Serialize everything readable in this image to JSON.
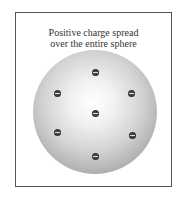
{
  "diagram": {
    "caption_line1": "Positive charge spread",
    "caption_line2": "over the entire sphere",
    "electrons": [
      {
        "x": 95,
        "y": 72,
        "label": "−"
      },
      {
        "x": 57,
        "y": 93,
        "label": "−"
      },
      {
        "x": 131,
        "y": 93,
        "label": "−"
      },
      {
        "x": 95,
        "y": 113,
        "label": "−"
      },
      {
        "x": 57,
        "y": 132,
        "label": "−"
      },
      {
        "x": 132,
        "y": 135,
        "label": "−"
      },
      {
        "x": 95,
        "y": 156,
        "label": "−"
      }
    ],
    "colors": {
      "frame": "#555555",
      "sphere_light": "#ffffff",
      "sphere_dark": "#8a8a8a",
      "electron": "#2e2e2e"
    }
  }
}
